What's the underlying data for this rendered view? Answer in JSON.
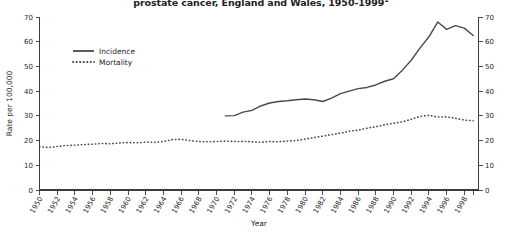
{
  "chart_data": {
    "type": "line",
    "title": "prostate cancer, England and Wales, 1950-1999",
    "title_superscript": "1",
    "xlabel": "Year",
    "ylabel": "Rate per 100,000",
    "ylim": [
      0,
      70
    ],
    "yticks": [
      0,
      10,
      20,
      30,
      40,
      50,
      60,
      70
    ],
    "xlim": [
      1950,
      1999
    ],
    "xticks": [
      1950,
      1952,
      1954,
      1956,
      1958,
      1960,
      1962,
      1964,
      1966,
      1968,
      1970,
      1972,
      1974,
      1976,
      1978,
      1980,
      1982,
      1984,
      1986,
      1988,
      1990,
      1992,
      1994,
      1996,
      1998
    ],
    "xtick_labels": [
      "1950",
      "1952",
      "1954",
      "1956",
      "1958",
      "1960",
      "1962",
      "1964",
      "1966",
      "1968",
      "1970",
      "1972",
      "1974",
      "1976",
      "1978",
      "1980",
      "1982",
      "1984",
      "1986",
      "1988",
      "1990",
      "1992",
      "1994",
      "1996",
      "1998"
    ],
    "grid": false,
    "legend_position": "top-left",
    "right_axis_mirrored": true,
    "right_yticks": [
      0,
      10,
      20,
      30,
      40,
      50,
      60,
      70
    ],
    "series": [
      {
        "name": "Incidence",
        "style": "solid",
        "color": "#4a4a4a",
        "x": [
          1971,
          1972,
          1973,
          1974,
          1975,
          1976,
          1977,
          1978,
          1979,
          1980,
          1981,
          1982,
          1983,
          1984,
          1985,
          1986,
          1987,
          1988,
          1989,
          1990,
          1991,
          1992,
          1993,
          1994,
          1995,
          1996,
          1997,
          1998,
          1999
        ],
        "values": [
          30.0,
          30.1,
          31.5,
          32.2,
          34.0,
          35.2,
          35.8,
          36.1,
          36.5,
          36.8,
          36.5,
          35.8,
          37.2,
          39.0,
          40.0,
          41.0,
          41.5,
          42.5,
          44.0,
          45.0,
          48.5,
          52.5,
          57.5,
          62.0,
          68.0,
          65.0,
          66.5,
          65.5,
          62.5
        ]
      },
      {
        "name": "Mortality",
        "style": "dotted",
        "color": "#4a4a4a",
        "x": [
          1950,
          1951,
          1952,
          1953,
          1954,
          1955,
          1956,
          1957,
          1958,
          1959,
          1960,
          1961,
          1962,
          1963,
          1964,
          1965,
          1966,
          1967,
          1968,
          1969,
          1970,
          1971,
          1972,
          1973,
          1974,
          1975,
          1976,
          1977,
          1978,
          1979,
          1980,
          1981,
          1982,
          1983,
          1984,
          1985,
          1986,
          1987,
          1988,
          1989,
          1990,
          1991,
          1992,
          1993,
          1994,
          1995,
          1996,
          1997,
          1998,
          1999
        ],
        "values": [
          17.5,
          17.2,
          17.6,
          18.0,
          18.1,
          18.4,
          18.5,
          18.8,
          18.7,
          19.0,
          19.2,
          19.1,
          19.4,
          19.3,
          19.6,
          20.4,
          20.5,
          20.0,
          19.6,
          19.5,
          19.6,
          19.8,
          19.6,
          19.7,
          19.5,
          19.3,
          19.6,
          19.5,
          19.8,
          20.0,
          20.6,
          21.2,
          21.8,
          22.4,
          23.0,
          23.8,
          24.2,
          25.0,
          25.6,
          26.4,
          27.0,
          27.6,
          28.6,
          29.8,
          30.2,
          29.5,
          29.6,
          29.0,
          28.3,
          28.0
        ]
      }
    ]
  }
}
